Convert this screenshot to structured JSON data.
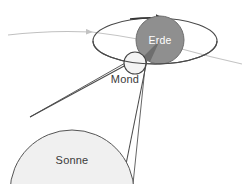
{
  "diagram": {
    "language": "de",
    "background_color": "#ffffff",
    "bodies": {
      "sun": {
        "label": "Sonne",
        "fill_color": "#f0f0f0",
        "stroke_color": "#555555",
        "label_color": "#3a3a3a",
        "center_x": 72,
        "center_y": 192,
        "radius": 62
      },
      "moon": {
        "label": "Mond",
        "fill_color": "#f4f4f4",
        "stroke_color": "#444444",
        "label_color": "#3a3a3a",
        "center_x": 135,
        "center_y": 63,
        "radius": 11
      },
      "earth": {
        "label": "Erde",
        "fill_color": "#8f8f8f",
        "stroke_color": "#6a6a6a",
        "label_color": "#ffffff",
        "umbra_color": "#6e6e6e",
        "center_x": 160,
        "center_y": 40,
        "radius": 24
      }
    },
    "orbits": {
      "moon_orbit": {
        "name": "Mondbahn",
        "stroke_color": "#4a4a4a",
        "center_x": 155,
        "center_y": 41,
        "radius_x": 62,
        "radius_y": 23,
        "direction": "clockwise",
        "arrow_label": "Umlaufrichtung"
      },
      "earth_orbit": {
        "name": "Erdbahn",
        "stroke_color": "#b9b9b9",
        "arrow_color": "#bdbdbd",
        "direction": "rightward"
      }
    },
    "shadow_cone": {
      "name": "Schattenkegel",
      "stroke_color": "#4a4a4a",
      "tangent_lines": 2
    }
  }
}
